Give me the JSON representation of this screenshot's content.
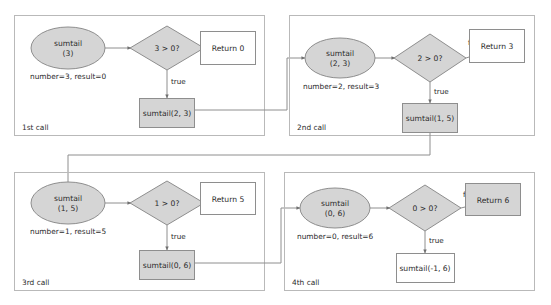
{
  "diagram": {
    "colors": {
      "shape_fill": "#d5d5d5",
      "shape_stroke": "#8e8e8e",
      "panel_stroke": "#b9b9b9",
      "plain_fill": "#ffffff",
      "text": "#2b2b2b",
      "background": "#ffffff"
    },
    "edge_labels": {
      "false": "false",
      "true": "true"
    },
    "panels": [
      {
        "id": "call-1",
        "caption": "1st call",
        "start_line1": "sumtail",
        "start_line2": "(3)",
        "decision": "3 > 0?",
        "note": "number=3, result=0",
        "return_label": "Return 0",
        "return_filled": false,
        "recurse_label": "sumtail(2, 3)",
        "recurse_filled": true
      },
      {
        "id": "call-2",
        "caption": "2nd call",
        "start_line1": "sumtail",
        "start_line2": "(2, 3)",
        "decision": "2 > 0?",
        "note": "number=2, result=3",
        "return_label": "Return 3",
        "return_filled": false,
        "recurse_label": "sumtail(1, 5)",
        "recurse_filled": true
      },
      {
        "id": "call-3",
        "caption": "3rd call",
        "start_line1": "sumtail",
        "start_line2": "(1, 5)",
        "decision": "1 > 0?",
        "note": "number=1, result=5",
        "return_label": "Return 5",
        "return_filled": false,
        "recurse_label": "sumtail(0, 6)",
        "recurse_filled": true
      },
      {
        "id": "call-4",
        "caption": "4th call",
        "start_line1": "sumtail",
        "start_line2": "(0, 6)",
        "decision": "0 > 0?",
        "note": "number=0, result=6",
        "return_label": "Return 6",
        "return_filled": true,
        "recurse_label": "sumtail(-1, 6)",
        "recurse_filled": false
      }
    ]
  }
}
